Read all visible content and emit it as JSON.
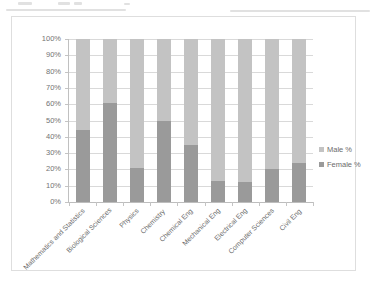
{
  "chart_data": {
    "type": "bar",
    "subtype": "stacked-100-percent",
    "title": "",
    "xlabel": "",
    "ylabel": "",
    "ylim": [
      0,
      100
    ],
    "ytick_labels": [
      "100%",
      "90%",
      "80%",
      "70%",
      "60%",
      "50%",
      "40%",
      "30%",
      "20%",
      "10%",
      "0%"
    ],
    "ytick_values": [
      100,
      90,
      80,
      70,
      60,
      50,
      40,
      30,
      20,
      10,
      0
    ],
    "grid": true,
    "legend_position": "right",
    "categories": [
      "Mathematics and Statistics",
      "Biological Sciences",
      "Physics",
      "Chemistry",
      "Chemical Eng",
      "Mechanical Eng",
      "Electrical Eng",
      "Computer Sciences",
      "Civil Eng"
    ],
    "series": [
      {
        "name": "Male %",
        "color": "#c3c3c3",
        "values": [
          56,
          39,
          79,
          50,
          65,
          87,
          88,
          80,
          76
        ]
      },
      {
        "name": "Female %",
        "color": "#9a9a9a",
        "values": [
          44,
          61,
          21,
          50,
          35,
          13,
          12,
          20,
          24
        ]
      }
    ]
  },
  "legend": {
    "items": [
      {
        "label": "Male %",
        "key": "male"
      },
      {
        "label": "Female %",
        "key": "female"
      }
    ]
  },
  "colors": {
    "male": "#c3c3c3",
    "female": "#9a9a9a",
    "gridline": "#d9d9d9",
    "axis": "#bdbdbd",
    "frame": "#dedede",
    "text": "#6b6b6b",
    "background": "#ffffff"
  }
}
